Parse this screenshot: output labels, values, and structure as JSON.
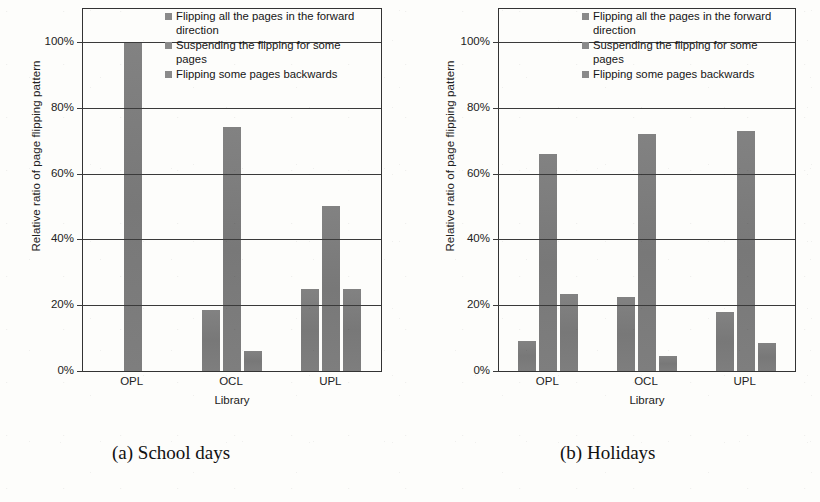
{
  "figure": {
    "panels": [
      {
        "caption": "(a) School days",
        "xlabel": "Library",
        "ylabel": "Relative ratio of page flipping pattern"
      },
      {
        "caption": "(b) Holidays",
        "xlabel": "Library",
        "ylabel": "Relative ratio of page flipping pattern"
      }
    ],
    "legend": [
      "Flipping all the pages in the forward direction",
      "Suspending the flipping for some pages",
      "Flipping some pages backwards"
    ],
    "yticks": [
      "0%",
      "20%",
      "40%",
      "60%",
      "80%",
      "100%"
    ],
    "xticks": [
      "OPL",
      "OCL",
      "UPL"
    ],
    "bar_color": "#7d7d7d",
    "axis_color": "#333333"
  },
  "chart_data": [
    {
      "type": "bar",
      "title": "(a) School days",
      "xlabel": "Library",
      "ylabel": "Relative ratio of page flipping pattern",
      "categories": [
        "OPL",
        "OCL",
        "UPL"
      ],
      "series": [
        {
          "name": "Flipping all the pages in the forward direction",
          "values": [
            0,
            18.5,
            25
          ]
        },
        {
          "name": "Suspending the flipping for some pages",
          "values": [
            100,
            74,
            50
          ]
        },
        {
          "name": "Flipping some pages backwards",
          "values": [
            0,
            6,
            25
          ]
        }
      ],
      "ylim": [
        0,
        110
      ],
      "ytick_values": [
        0,
        20,
        40,
        60,
        80,
        100
      ],
      "ytick_labels": [
        "0%",
        "20%",
        "40%",
        "60%",
        "80%",
        "100%"
      ],
      "grid": true,
      "legend_position": "inside-top-right"
    },
    {
      "type": "bar",
      "title": "(b) Holidays",
      "xlabel": "Library",
      "ylabel": "Relative ratio of page flipping pattern",
      "categories": [
        "OPL",
        "OCL",
        "UPL"
      ],
      "series": [
        {
          "name": "Flipping all the pages in the forward direction",
          "values": [
            9,
            22.5,
            18
          ]
        },
        {
          "name": "Suspending the flipping for some pages",
          "values": [
            66,
            72,
            73
          ]
        },
        {
          "name": "Flipping some pages backwards",
          "values": [
            23.5,
            4.5,
            8.5
          ]
        }
      ],
      "ylim": [
        0,
        110
      ],
      "ytick_values": [
        0,
        20,
        40,
        60,
        80,
        100
      ],
      "ytick_labels": [
        "0%",
        "20%",
        "40%",
        "60%",
        "80%",
        "100%"
      ],
      "grid": true,
      "legend_position": "inside-top-right"
    }
  ]
}
